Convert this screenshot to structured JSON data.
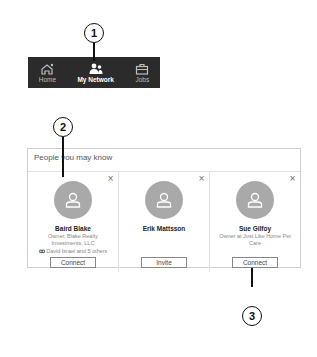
{
  "navbar": {
    "items": [
      {
        "label": "Home",
        "icon": "home-icon",
        "active": false
      },
      {
        "label": "My Network",
        "icon": "network-icon",
        "active": true
      },
      {
        "label": "Jobs",
        "icon": "briefcase-icon",
        "active": false
      }
    ]
  },
  "callouts": [
    "1",
    "2",
    "3"
  ],
  "pymk": {
    "title": "People you may know",
    "dismiss_symbol": "×",
    "cards": [
      {
        "name": "Baird Blake",
        "headline": "Owner, Blake Realty Investments, LLC",
        "mutual": "David Israel and 5 others",
        "mutual_icon": "ꝏ",
        "button": "Connect"
      },
      {
        "name": "Erik Mattsson",
        "headline": "",
        "mutual": "",
        "button": "Invite"
      },
      {
        "name": "Sue Gilfoy",
        "headline": "Owner at Just Like Home Pet Care",
        "mutual": "",
        "button": "Connect"
      }
    ]
  },
  "colors": {
    "navbar_bg": "#2b2b2b",
    "avatar_bg": "#a9a9a9",
    "panel_border": "#cfcfcf"
  }
}
